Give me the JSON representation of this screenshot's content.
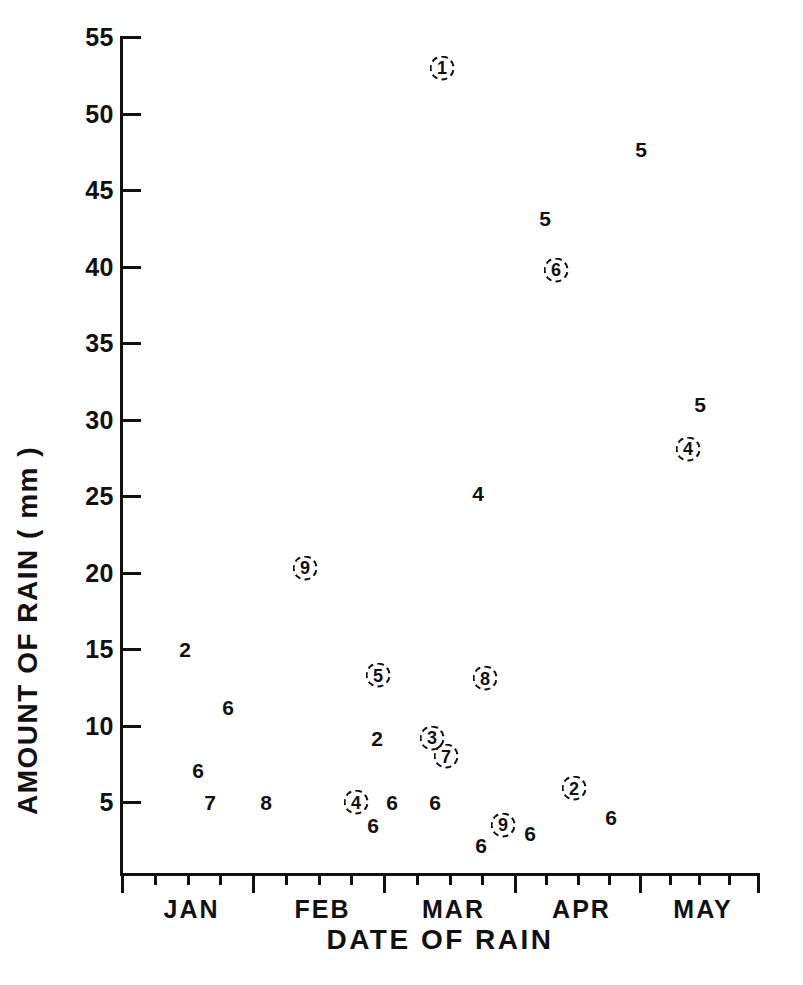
{
  "chart_data": {
    "type": "scatter",
    "title": "",
    "xlabel": "DATE OF RAIN",
    "ylabel": "AMOUNT OF RAIN ( mm )",
    "ylim": [
      0,
      55
    ],
    "yticks": [
      5,
      10,
      15,
      20,
      25,
      30,
      35,
      40,
      45,
      50,
      55
    ],
    "ytick_labels": [
      "5",
      "10",
      "15",
      "20",
      "25",
      "30",
      "35",
      "40",
      "45",
      "50",
      "55"
    ],
    "xtick_labels": [
      "JAN",
      "FEB",
      "MAR",
      "APR",
      "MAY"
    ],
    "x_axis_note": "month-boundary major ticks with 3 weekly minor ticks between",
    "grid": false,
    "legend": null,
    "marker_style": "numeric text labels; some enclosed in a circle outline",
    "points": [
      {
        "label": "2",
        "circled": false,
        "x_month": "JAN",
        "x_px": 185,
        "y_value": 15.0
      },
      {
        "label": "6",
        "circled": false,
        "x_month": "JAN",
        "x_px": 228,
        "y_value": 11.2
      },
      {
        "label": "6",
        "circled": false,
        "x_month": "JAN",
        "x_px": 198,
        "y_value": 7.1
      },
      {
        "label": "7",
        "circled": false,
        "x_month": "JAN",
        "x_px": 210,
        "y_value": 5.0
      },
      {
        "label": "8",
        "circled": false,
        "x_month": "FEB",
        "x_px": 266,
        "y_value": 5.0
      },
      {
        "label": "9",
        "circled": true,
        "x_month": "FEB",
        "x_px": 305,
        "y_value": 20.3
      },
      {
        "label": "4",
        "circled": true,
        "x_month": "FEB",
        "x_px": 356,
        "y_value": 5.0
      },
      {
        "label": "6",
        "circled": false,
        "x_month": "FEB",
        "x_px": 373,
        "y_value": 3.5
      },
      {
        "label": "5",
        "circled": true,
        "x_month": "FEB",
        "x_px": 378,
        "y_value": 13.3
      },
      {
        "label": "2",
        "circled": false,
        "x_month": "FEB",
        "x_px": 377,
        "y_value": 9.2
      },
      {
        "label": "6",
        "circled": false,
        "x_month": "FEB",
        "x_px": 392,
        "y_value": 5.0
      },
      {
        "label": "3",
        "circled": true,
        "x_month": "MAR",
        "x_px": 432,
        "y_value": 9.2
      },
      {
        "label": "6",
        "circled": false,
        "x_month": "MAR",
        "x_px": 435,
        "y_value": 5.0
      },
      {
        "label": "1",
        "circled": true,
        "x_month": "MAR",
        "x_px": 442,
        "y_value": 53.0
      },
      {
        "label": "7",
        "circled": true,
        "x_month": "MAR",
        "x_px": 446,
        "y_value": 8.0
      },
      {
        "label": "6",
        "circled": false,
        "x_month": "MAR",
        "x_px": 481,
        "y_value": 2.2
      },
      {
        "label": "4",
        "circled": false,
        "x_month": "MAR",
        "x_px": 478,
        "y_value": 25.2
      },
      {
        "label": "8",
        "circled": true,
        "x_month": "MAR",
        "x_px": 485,
        "y_value": 13.1
      },
      {
        "label": "9",
        "circled": true,
        "x_month": "MAR",
        "x_px": 503,
        "y_value": 3.5
      },
      {
        "label": "6",
        "circled": false,
        "x_month": "MAR",
        "x_px": 530,
        "y_value": 3.0
      },
      {
        "label": "5",
        "circled": false,
        "x_month": "APR",
        "x_px": 545,
        "y_value": 43.2
      },
      {
        "label": "6",
        "circled": true,
        "x_month": "APR",
        "x_px": 556,
        "y_value": 39.8
      },
      {
        "label": "2",
        "circled": true,
        "x_month": "APR",
        "x_px": 574,
        "y_value": 5.9
      },
      {
        "label": "6",
        "circled": false,
        "x_month": "APR",
        "x_px": 611,
        "y_value": 4.0
      },
      {
        "label": "5",
        "circled": false,
        "x_month": "MAY",
        "x_px": 641,
        "y_value": 47.7
      },
      {
        "label": "5",
        "circled": false,
        "x_month": "MAY",
        "x_px": 700,
        "y_value": 31.0
      },
      {
        "label": "4",
        "circled": true,
        "x_month": "MAY",
        "x_px": 688,
        "y_value": 28.1
      }
    ]
  },
  "axes": {
    "x_label": "DATE OF RAIN",
    "y_label": "AMOUNT OF RAIN ( mm )",
    "y_tick_labels": [
      "55",
      "50",
      "45",
      "40",
      "35",
      "30",
      "25",
      "20",
      "15",
      "10",
      "5"
    ],
    "x_tick_labels": [
      "JAN",
      "FEB",
      "MAR",
      "APR",
      "MAY"
    ]
  },
  "colors": {
    "ink": "#111111",
    "paper": "#ffffff"
  }
}
